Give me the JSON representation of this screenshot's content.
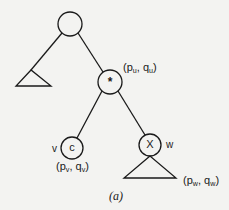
{
  "figure": {
    "caption": "(a)",
    "nodes": {
      "root": {
        "label": ""
      },
      "star": {
        "label": "*",
        "coord": {
          "p": "p",
          "p_sub": "u",
          "sep": ", ",
          "q": "q",
          "q_sub": "u"
        }
      },
      "c": {
        "label": "c",
        "name": "v",
        "coord": {
          "p": "p",
          "p_sub": "v",
          "sep": ", ",
          "q": "q",
          "q_sub": "v"
        }
      },
      "x": {
        "label": "X",
        "name": "w"
      },
      "subtree_w": {
        "coord": {
          "p": "p",
          "p_sub": "w",
          "sep": ", ",
          "q": "q",
          "q_sub": "w"
        }
      }
    },
    "colors": {
      "ink": "#1a1a1a",
      "paper": "#f3f3f1"
    }
  }
}
